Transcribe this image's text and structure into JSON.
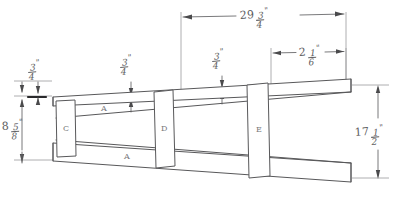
{
  "drawing": {
    "title": "Tapered frame assembly sketch",
    "type": "hand-drawn engineering dimension sketch",
    "line_color": "#58585a",
    "dim_color": "#6a6a6c",
    "background": "#ffffff",
    "units": "inches"
  },
  "dimensions": [
    {
      "id": "overall-length",
      "whole": "29",
      "numerator": "3",
      "denominator": "4",
      "unit_mark": "\"",
      "text": "29 3/4\"",
      "orientation": "horizontal",
      "position": "top"
    },
    {
      "id": "segment-right",
      "whole": "2",
      "numerator": "1",
      "denominator": "6",
      "unit_mark": "\"",
      "text": "2 1/6\"",
      "orientation": "horizontal",
      "position": "top-right"
    },
    {
      "id": "top-rail-thickness-left",
      "whole": "",
      "numerator": "3",
      "denominator": "4",
      "unit_mark": "\"",
      "text": "3/4\"",
      "orientation": "vertical",
      "position": "upper-left"
    },
    {
      "id": "top-rail-thickness-mid",
      "whole": "",
      "numerator": "3",
      "denominator": "4",
      "unit_mark": "\"",
      "text": "3/4\"",
      "orientation": "vertical",
      "position": "upper-center"
    },
    {
      "id": "top-rail-thickness-right",
      "whole": "",
      "numerator": "3",
      "denominator": "4",
      "unit_mark": "\"",
      "text": "3/4\"",
      "orientation": "vertical",
      "position": "upper-center-right"
    },
    {
      "id": "left-height",
      "whole": "8",
      "numerator": "5",
      "denominator": "8",
      "unit_mark": "\"",
      "text": "8 5/8\"",
      "orientation": "vertical",
      "position": "left"
    },
    {
      "id": "right-height",
      "whole": "17",
      "numerator": "1",
      "denominator": "2",
      "unit_mark": "\"",
      "text": "17 1/2\"",
      "orientation": "vertical",
      "position": "right"
    }
  ],
  "parts": [
    {
      "id": "post-c",
      "label": "C",
      "position": "left-upright"
    },
    {
      "id": "post-d",
      "label": "D",
      "position": "middle-upright"
    },
    {
      "id": "post-e",
      "label": "E",
      "position": "right-upright"
    },
    {
      "id": "rail-a-upper",
      "label": "A",
      "position": "upper-rail"
    },
    {
      "id": "rail-a-lower",
      "label": "A",
      "position": "lower-rail"
    }
  ]
}
